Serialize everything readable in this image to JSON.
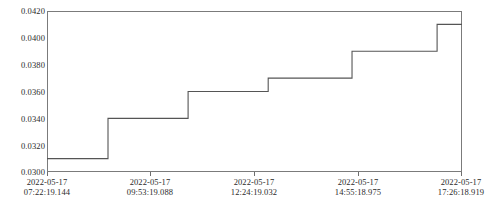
{
  "chart_data": {
    "type": "line",
    "line_style": "step-post",
    "title": "",
    "xlabel": "",
    "ylabel": "",
    "grid": false,
    "legend": null,
    "line_color": "#555555",
    "background_color": "#ffffff",
    "axis_color": "#7b7b7b",
    "ylim": [
      0.03,
      0.042
    ],
    "yticks": [
      0.03,
      0.032,
      0.034,
      0.036,
      0.038,
      0.04,
      0.042
    ],
    "ytick_labels": [
      "0.0300",
      "0.0320",
      "0.0340",
      "0.0360",
      "0.0380",
      "0.0400",
      "0.0420"
    ],
    "xtick_labels": [
      {
        "date": "2022-05-17",
        "time": "07:22:19.144"
      },
      {
        "date": "2022-05-17",
        "time": "09:53:19.088"
      },
      {
        "date": "2022-05-17",
        "time": "12:24:19.032"
      },
      {
        "date": "2022-05-17",
        "time": "14:55:18.975"
      },
      {
        "date": "2022-05-17",
        "time": "17:26:18.919"
      }
    ],
    "xlim": [
      "2022-05-17 07:22:19.144",
      "2022-05-17 17:26:18.919"
    ],
    "x": [
      "2022-05-17 07:22:19.144",
      "2022-05-17 09:14:00",
      "2022-05-17 11:10:00",
      "2022-05-17 13:06:00",
      "2022-05-17 15:08:00",
      "2022-05-17 17:12:00",
      "2022-05-17 17:26:18.919"
    ],
    "values": [
      0.031,
      0.034,
      0.036,
      0.037,
      0.039,
      0.041,
      0.041
    ],
    "step_points": [
      {
        "x_frac": 0.0,
        "y": 0.031
      },
      {
        "x_frac": 0.147,
        "y": 0.034
      },
      {
        "x_frac": 0.34,
        "y": 0.036
      },
      {
        "x_frac": 0.533,
        "y": 0.037
      },
      {
        "x_frac": 0.735,
        "y": 0.039
      },
      {
        "x_frac": 0.94,
        "y": 0.041
      },
      {
        "x_frac": 1.0,
        "y": 0.041
      }
    ]
  }
}
